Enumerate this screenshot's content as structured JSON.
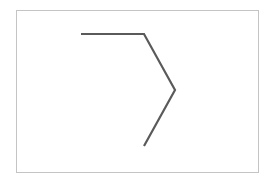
{
  "canvas": {
    "width": 276,
    "height": 185,
    "background": "#ffffff"
  },
  "frame": {
    "x": 16,
    "y": 10,
    "width": 243,
    "height": 163,
    "border_color": "#c4c4c4"
  },
  "polyline": {
    "stroke": "#5a5a5a",
    "stroke_width": 2.2,
    "points": [
      {
        "x": 81,
        "y": 34
      },
      {
        "x": 144,
        "y": 34
      },
      {
        "x": 175,
        "y": 90
      },
      {
        "x": 144,
        "y": 146
      }
    ],
    "points_attr": "81,34 144,34 175,90 144,146"
  }
}
